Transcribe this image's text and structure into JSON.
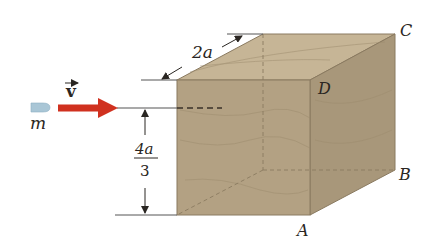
{
  "figure": {
    "type": "physics-diagram",
    "colors": {
      "background": "#ffffff",
      "front_face": "#b3a183",
      "top_face": "#c6b596",
      "right_face": "#a8977a",
      "edge": "#8a7a60",
      "arrow": "#d0311f",
      "bullet": "#a9c6d6",
      "ink": "#2a2622"
    },
    "labels": {
      "mass": "m",
      "velocity_symbol": "v",
      "depth_dimension": "2a",
      "height_numerator": "4a",
      "height_denominator": "3",
      "corner_a": "A",
      "corner_b": "B",
      "corner_c": "C",
      "corner_d": "D"
    }
  }
}
